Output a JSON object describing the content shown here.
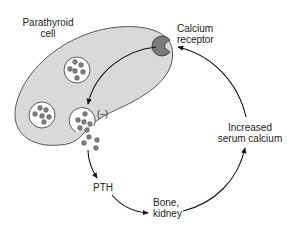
{
  "diagram": {
    "type": "feedback-loop",
    "labels": {
      "cell": "Parathyroid cell",
      "cell_line1": "Parathyroid",
      "cell_line2": "cell",
      "receptor_line1": "Calcium",
      "receptor_line2": "receptor",
      "inhibition": "(–)",
      "pth": "PTH",
      "target_line1": "Bone,",
      "target_line2": "kidney",
      "effect_line1": "Increased",
      "effect_line2": "serum calcium"
    },
    "colors": {
      "cell_fill": "#d9d9d9",
      "outline": "#333333",
      "receptor_fill": "#7a7a7a",
      "granule_fill": "#808080",
      "vesicle_fill": "#ffffff",
      "arrow": "#111111"
    },
    "flow": [
      {
        "from": "Calcium receptor",
        "to": "Secretory vesicle",
        "effect": "(–)"
      },
      {
        "from": "Parathyroid cell",
        "to": "PTH"
      },
      {
        "from": "PTH",
        "to": "Bone, kidney"
      },
      {
        "from": "Bone, kidney",
        "to": "Increased serum calcium"
      },
      {
        "from": "Increased serum calcium",
        "to": "Calcium receptor"
      }
    ]
  }
}
